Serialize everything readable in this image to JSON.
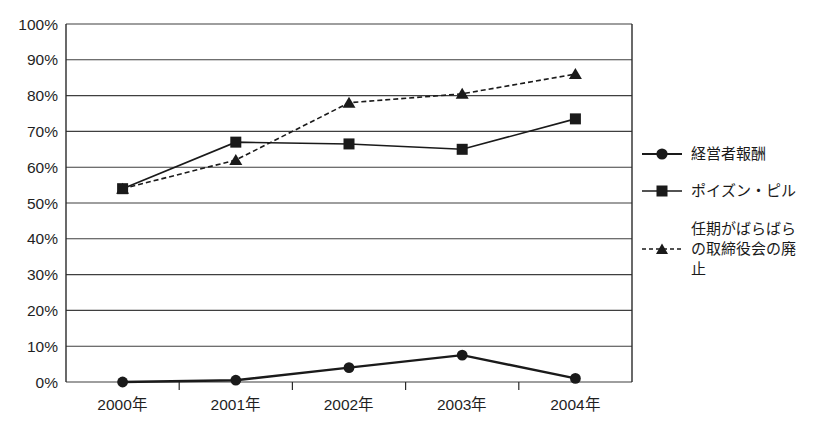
{
  "figure": {
    "background": "#ffffff",
    "line_color": "#1a1a1a",
    "grid_color": "#3f3f3f",
    "axis_color": "#2a2a2a",
    "label_color": "#1f1f1f"
  },
  "chart_data": {
    "type": "line",
    "title": "",
    "xlabel": "",
    "ylabel": "",
    "categories": [
      "2000年",
      "2001年",
      "2002年",
      "2003年",
      "2004年"
    ],
    "series": [
      {
        "name": "経営者報酬",
        "marker": "circle",
        "line_style": "solid",
        "values": [
          0,
          0.5,
          4,
          7.5,
          1
        ]
      },
      {
        "name": "ポイズン・ピル",
        "marker": "square",
        "line_style": "solid",
        "values": [
          54,
          67,
          66.5,
          65,
          73.5
        ]
      },
      {
        "name": "任期がばらばらの取締役会の廃止",
        "marker": "triangle",
        "line_style": "dashed",
        "values": [
          54,
          62,
          78,
          80.5,
          86
        ]
      }
    ],
    "ylim": [
      0,
      100
    ],
    "y_step": 10,
    "y_tick_labels": [
      "0%",
      "10%",
      "20%",
      "30%",
      "40%",
      "50%",
      "60%",
      "70%",
      "80%",
      "90%",
      "100%"
    ],
    "grid": "horizontal",
    "legend_position": "right"
  }
}
